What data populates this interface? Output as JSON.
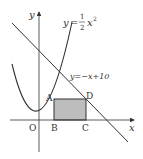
{
  "figure": {
    "axes": {
      "x_label": "x",
      "y_label": "y",
      "origin_label": "O"
    },
    "curves": {
      "parabola": {
        "label_lhs": "y",
        "label_eq": "=",
        "frac_num": "1",
        "frac_den": "2",
        "label_var": "x",
        "label_exp": "2"
      },
      "line": {
        "label": "y=−x+10"
      }
    },
    "points": {
      "A": "A",
      "B": "B",
      "C": "C",
      "D": "D"
    },
    "rectangle": {
      "fill": "#bdbdbd",
      "stroke": "#333333"
    }
  }
}
